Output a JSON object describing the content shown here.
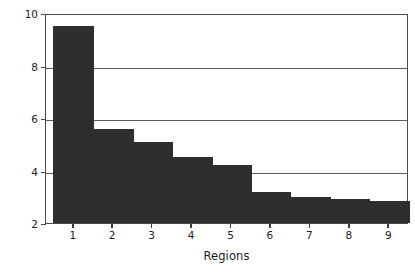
{
  "chart_data": {
    "type": "bar",
    "title": "",
    "xlabel": "Regions",
    "ylabel": "Number of agencies consulted",
    "categories": [
      "1",
      "2",
      "3",
      "4",
      "5",
      "6",
      "7",
      "8",
      "9"
    ],
    "values": [
      9.5,
      5.6,
      5.1,
      4.5,
      4.2,
      3.2,
      3.0,
      2.9,
      2.85
    ],
    "ylim": [
      2,
      10
    ],
    "yticks": [
      2,
      4,
      6,
      8,
      10
    ],
    "ytick_labels": [
      "2",
      "4",
      "6",
      "8",
      "10"
    ],
    "xtick_labels": [
      "1",
      "2",
      "3",
      "4",
      "5",
      "6",
      "7",
      "8",
      "9"
    ],
    "grid": true,
    "gridlines_at": [
      4,
      6,
      8,
      10
    ],
    "legend": null,
    "bar_color": "#2e2e2e",
    "axis_color": "#4a4a4a",
    "background": "#ffffff"
  },
  "axes": {
    "y_title": "Number of agencies consulted",
    "x_title": "Regions"
  }
}
